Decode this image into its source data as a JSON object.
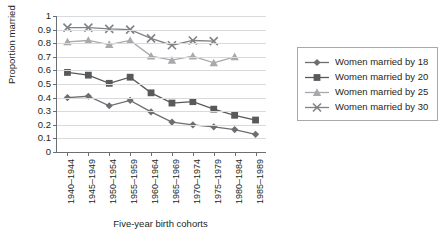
{
  "chart_data": {
    "type": "line",
    "title": "",
    "xlabel": "Five-year birth cohorts",
    "ylabel": "Proportion married",
    "ylim": [
      0,
      1
    ],
    "ytick_labels": [
      "1",
      "0.9",
      "0.8",
      "0.7",
      "0.6",
      "0.5",
      "0.4",
      "0.3",
      "0.2",
      "0.1",
      "0"
    ],
    "ytick_values": [
      1,
      0.9,
      0.8,
      0.7,
      0.6,
      0.5,
      0.4,
      0.3,
      0.2,
      0.1,
      0
    ],
    "grid": true,
    "legend_position": "right",
    "categories": [
      "1940–1944",
      "1945–1949",
      "1950–1954",
      "1955–1959",
      "1960–1964",
      "1965–1969",
      "1970–1974",
      "1975–1979",
      "1980–1984",
      "1985–1989"
    ],
    "series": [
      {
        "name": "Women married by 18",
        "marker": "diamond",
        "color": "#6d6e71",
        "values": [
          0.4,
          0.41,
          0.34,
          0.38,
          0.295,
          0.22,
          0.2,
          0.185,
          0.165,
          0.13
        ]
      },
      {
        "name": "Women married by 20",
        "marker": "square",
        "color": "#58595b",
        "values": [
          0.585,
          0.565,
          0.505,
          0.55,
          0.435,
          0.36,
          0.37,
          0.315,
          0.27,
          0.235
        ]
      },
      {
        "name": "Women married by 25",
        "marker": "triangle",
        "color": "#a7a9ac",
        "values": [
          0.81,
          0.82,
          0.79,
          0.82,
          0.705,
          0.675,
          0.705,
          0.655,
          0.7,
          null
        ]
      },
      {
        "name": "Women married by 30",
        "marker": "x",
        "color": "#808285",
        "values": [
          0.915,
          0.915,
          0.905,
          0.9,
          0.835,
          0.785,
          0.82,
          0.815,
          null,
          null
        ]
      }
    ]
  },
  "legend": {
    "items": [
      {
        "label": "Women married by 18"
      },
      {
        "label": "Women married by 20"
      },
      {
        "label": "Women married by 25"
      },
      {
        "label": "Women married by 30"
      }
    ]
  }
}
